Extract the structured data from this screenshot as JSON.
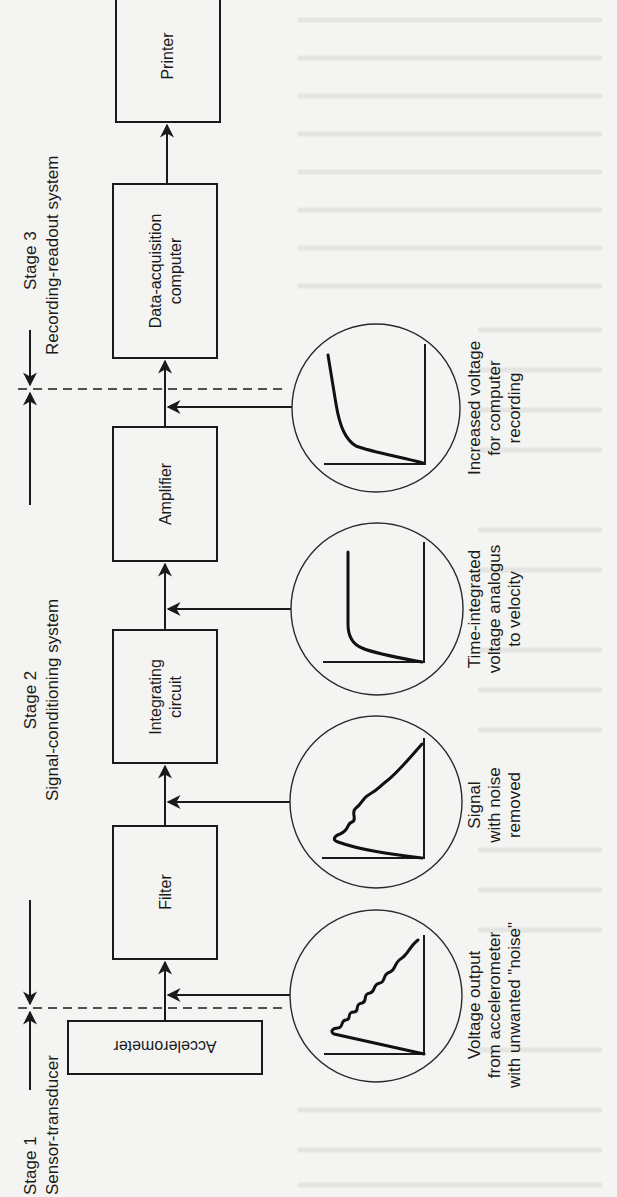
{
  "figure": {
    "orientation": "rotated-90-ccw",
    "colors": {
      "ink": "#1a1a1a",
      "paper": "#f4f4f2"
    },
    "stages": [
      {
        "id": "stage1",
        "title": "Stage 1",
        "subtitle": "Sensor-transducer"
      },
      {
        "id": "stage2",
        "title": "Stage 2",
        "subtitle": "Signal-conditioning system"
      },
      {
        "id": "stage3",
        "title": "Stage 3",
        "subtitle": "Recording-readout system"
      }
    ],
    "blocks": [
      {
        "id": "accelerometer",
        "label": "Accelerometer"
      },
      {
        "id": "filter",
        "label": "Filter"
      },
      {
        "id": "integrating",
        "line1": "Integrating",
        "line2": "circuit"
      },
      {
        "id": "amplifier",
        "label": "Amplifier"
      },
      {
        "id": "daq",
        "line1": "Data-acquisition",
        "line2": "computer"
      },
      {
        "id": "printer",
        "label": "Printer"
      }
    ],
    "signals": [
      {
        "id": "raw",
        "waveform": "noisy-ramp",
        "lines": [
          "Voltage output",
          "from accelerometer",
          "with unwanted \"noise\""
        ]
      },
      {
        "id": "filtered",
        "waveform": "smooth-ramp",
        "lines": [
          "Signal",
          "with noise",
          "removed"
        ]
      },
      {
        "id": "integrated",
        "waveform": "velocity-curve",
        "lines": [
          "Time-integrated",
          "voltage analogus",
          "to velocity"
        ]
      },
      {
        "id": "amplified",
        "waveform": "amplified-curve",
        "lines": [
          "Increased voltage",
          "for computer",
          "recording"
        ]
      }
    ]
  }
}
